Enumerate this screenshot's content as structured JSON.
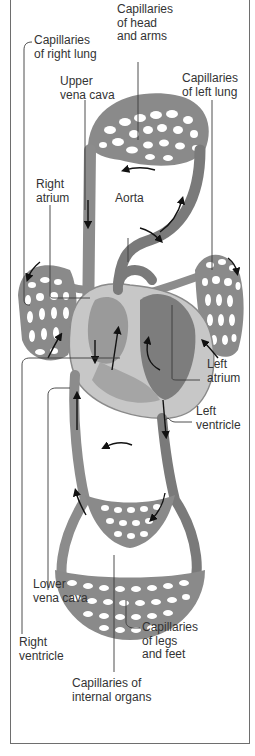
{
  "labels": {
    "cap_right_lung": "Capillaries\nof right lung",
    "cap_head_arms": "Capillaries\nof head\nand arms",
    "upper_vena_cava": "Upper\nvena cava",
    "cap_left_lung": "Capillaries\nof left lung",
    "right_atrium": "Right\natrium",
    "aorta": "Aorta",
    "left_atrium": "Left\natrium",
    "left_ventricle": "Left\nventricle",
    "lower_vena_cava": "Lower\nvena cava",
    "right_ventricle": "Right\nventricle",
    "cap_legs_feet": "Capillaries\nof legs\nand feet",
    "cap_internal_organs": "Capillaries of\ninternal organs"
  },
  "icons": {
    "flow_arrow": "flow-arrow-icon"
  },
  "colors": {
    "vessel": "#8c8c8c",
    "heart_dark": "#7d7d7d",
    "heart_light": "#c9c9c9",
    "border": "#6e6e6e",
    "text": "#333333"
  }
}
